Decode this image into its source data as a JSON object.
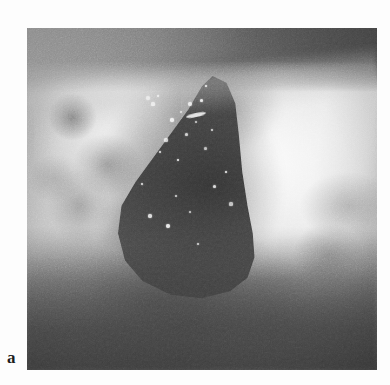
{
  "figure": {
    "panel_label": "a",
    "caption": "",
    "image_kind": "clinical-photograph",
    "rendering": "grayscale halftone print"
  },
  "photo": {
    "alt_description": "Grayscale clinical photograph of a deep open wound cavity on skin, with a dark triangular defect at centre, pale surrounding tissue to the right and mottled skin to the left",
    "frame": {
      "x": 27,
      "y": 28,
      "width": 350,
      "height": 342
    },
    "regions": [
      {
        "name": "upper-dark-band",
        "description": "dark shadowed band across the top of the frame, darkening toward the right"
      },
      {
        "name": "left-skin-field",
        "description": "mottled mid-grey skin surface with darker bruise-like blotches"
      },
      {
        "name": "wound-cavity",
        "description": "large dark pointed cavity occupying the centre, apex toward the upper middle"
      },
      {
        "name": "right-bright-tissue",
        "description": "near-white highly reflective tissue / drape on the right flank"
      },
      {
        "name": "lower-tissue-band",
        "description": "mid-dark tissue band across the bottom with a diagonal lighter streak"
      }
    ],
    "speckles": [
      {
        "x": 148,
        "y": 98,
        "r": 2.0
      },
      {
        "x": 153,
        "y": 104,
        "r": 1.6
      },
      {
        "x": 158,
        "y": 96,
        "r": 1.3
      },
      {
        "x": 172,
        "y": 120,
        "r": 1.8
      },
      {
        "x": 181,
        "y": 112,
        "r": 1.4
      },
      {
        "x": 186,
        "y": 134,
        "r": 1.5
      },
      {
        "x": 190,
        "y": 104,
        "r": 2.2
      },
      {
        "x": 201,
        "y": 100,
        "r": 1.5
      },
      {
        "x": 196,
        "y": 122,
        "r": 1.2
      },
      {
        "x": 166,
        "y": 140,
        "r": 1.6
      },
      {
        "x": 160,
        "y": 152,
        "r": 1.4
      },
      {
        "x": 178,
        "y": 160,
        "r": 1.3
      },
      {
        "x": 205,
        "y": 148,
        "r": 1.5
      },
      {
        "x": 212,
        "y": 130,
        "r": 1.2
      },
      {
        "x": 150,
        "y": 216,
        "r": 1.7
      },
      {
        "x": 168,
        "y": 226,
        "r": 2.0
      },
      {
        "x": 190,
        "y": 212,
        "r": 1.4
      },
      {
        "x": 176,
        "y": 196,
        "r": 1.2
      },
      {
        "x": 214,
        "y": 186,
        "r": 1.5
      },
      {
        "x": 226,
        "y": 172,
        "r": 1.3
      },
      {
        "x": 231,
        "y": 204,
        "r": 1.6
      },
      {
        "x": 198,
        "y": 244,
        "r": 1.3
      },
      {
        "x": 142,
        "y": 184,
        "r": 1.2
      },
      {
        "x": 206,
        "y": 86,
        "r": 1.4
      }
    ],
    "highlight_streak": {
      "name": "specular-streak",
      "x": 186,
      "y": 113,
      "width": 20,
      "height": 4,
      "angle": -12
    }
  },
  "colors": {
    "page_background": "#ffffff",
    "label_text": "#1d1d1d",
    "photo_darkest": "#3d3d3d",
    "photo_midtone": "#8e8e8e",
    "photo_brightest": "#f0f0f0",
    "speckle": "#f4f4f4"
  }
}
